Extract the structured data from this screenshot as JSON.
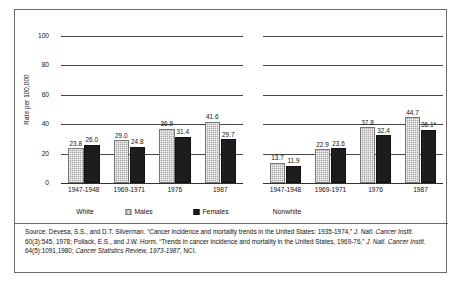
{
  "chart_data": {
    "type": "bar",
    "title": "",
    "subtitle": "",
    "xlabel": "",
    "ylabel": "Rate per 100,000",
    "ylim": [
      0,
      100
    ],
    "y_ticks": [
      "0",
      "20",
      "40",
      "60",
      "80",
      "100"
    ],
    "grid": true,
    "legend_position": "below-axis",
    "panels": [
      {
        "name": "White",
        "categories": [
          "1947-1948",
          "1969-1971",
          "1976",
          "1987"
        ],
        "series": [
          {
            "name": "Males",
            "values": [
              23.8,
              29.0,
              36.9,
              41.6
            ],
            "labels": [
              "23.8",
              "29.0",
              "36.9",
              "41.6"
            ]
          },
          {
            "name": "Females",
            "values": [
              26.0,
              24.8,
              31.4,
              29.7
            ],
            "labels": [
              "26.0",
              "24.8",
              "31.4",
              "29.7"
            ]
          }
        ]
      },
      {
        "name": "Nonwhite",
        "categories": [
          "1947-1948",
          "1969-1971",
          "1976",
          "1987"
        ],
        "series": [
          {
            "name": "Males",
            "values": [
              13.7,
              22.9,
              37.8,
              44.7
            ],
            "labels": [
              "13.7",
              "22.9",
              "37.8",
              "44.7"
            ]
          },
          {
            "name": "Females",
            "values": [
              11.9,
              23.6,
              32.4,
              36.1
            ],
            "labels": [
              "11.9",
              "23.6",
              "32.4",
              "36.1*"
            ]
          }
        ]
      }
    ],
    "legend": [
      {
        "label": "Males",
        "color": "#a8a8a8",
        "pattern": "stippled"
      },
      {
        "label": "Females",
        "color": "#1d1d1d",
        "pattern": "solid"
      }
    ],
    "colors": {
      "males": "#a8a8a8",
      "females": "#1d1d1d",
      "gridline": "#4a4a4a",
      "frame": "#6b6b6b",
      "background": "#ffffff",
      "text": "#111111"
    }
  },
  "source_note": {
    "segments": [
      {
        "text": "Source:  Devesa, S.S., and D.T. Silverman. “Cancer incidence and mortality trends in the United States: 1935-1974,” ",
        "italic": false
      },
      {
        "text": "J. Natl. Cancer Instit.",
        "italic": true
      },
      {
        "text": " 60(3):545, 1978; Pollack, E.S., and J.W. Horm. “Trends in cancer incidence and mortality in the United States, 1969-76,” ",
        "italic": false
      },
      {
        "text": "J. Natl. Cancer Instit.",
        "italic": true
      },
      {
        "text": " 64(5):1091,1980; ",
        "italic": false
      },
      {
        "text": "Cancer Statistics Review, 1973-1987,",
        "italic": true
      },
      {
        "text": " NCI.",
        "italic": false
      }
    ]
  }
}
